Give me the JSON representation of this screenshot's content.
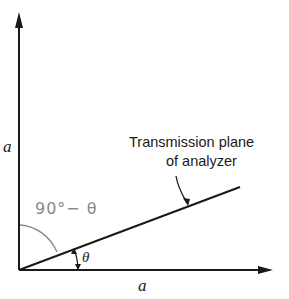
{
  "diagram": {
    "axes": {
      "vertical_label": "a",
      "horizontal_label": "a"
    },
    "annotation": {
      "line1": "Transmission plane",
      "line2": "of analyzer"
    },
    "angles": {
      "theta_label": "θ",
      "complement_label": "90°− θ"
    },
    "colors": {
      "ink": "#1a1a1a",
      "handwriting": "#8a8a8a",
      "background": "#ffffff"
    }
  }
}
